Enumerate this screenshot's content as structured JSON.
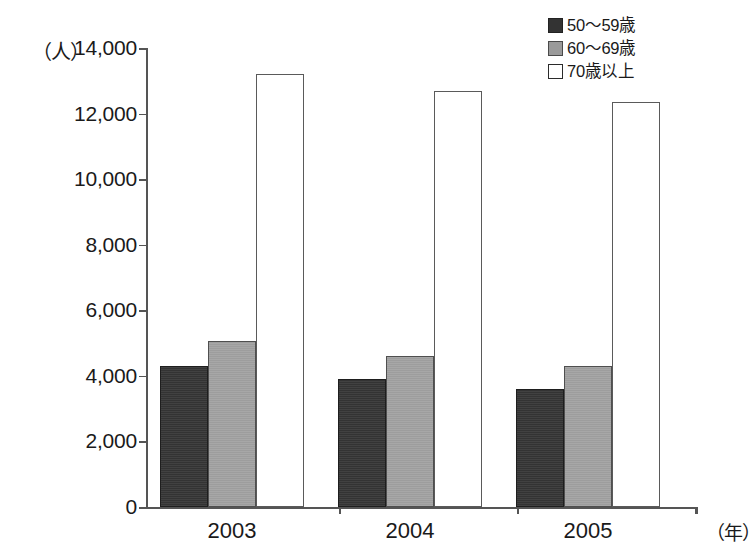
{
  "chart_data": {
    "type": "bar",
    "title": "",
    "xlabel": "（年）",
    "ylabel": "（人）",
    "categories": [
      "2003",
      "2004",
      "2005"
    ],
    "ytick_labels": [
      "14,000",
      "12,000",
      "10,000",
      "8,000",
      "6,000",
      "4,000",
      "2,000",
      "0"
    ],
    "ytick_values": [
      14000,
      12000,
      10000,
      8000,
      6000,
      4000,
      2000,
      0
    ],
    "ylim": [
      0,
      14000
    ],
    "grid": false,
    "legend_position": "top-right",
    "series": [
      {
        "name": "50〜59歳",
        "color": "#333333",
        "swatch": "sw-dark",
        "values": [
          4300,
          3900,
          3600
        ]
      },
      {
        "name": "60〜69歳",
        "color": "#9d9d9d",
        "swatch": "sw-gray",
        "values": [
          5050,
          4600,
          4300
        ]
      },
      {
        "name": "70歳以上",
        "color": "#ffffff",
        "swatch": "sw-white",
        "values": [
          13200,
          12700,
          12350
        ]
      }
    ]
  },
  "axis": {
    "unit_y": "（人）",
    "unit_x": "（年）"
  }
}
